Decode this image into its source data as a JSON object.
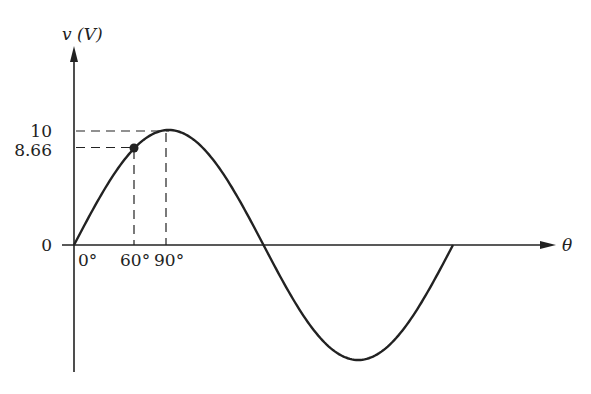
{
  "chart_data": {
    "type": "line",
    "title": "",
    "xlabel": "θ",
    "ylabel": "v (V)",
    "x_ticks": [
      "0°",
      "60°",
      "90°"
    ],
    "y_ticks": [
      "0",
      "8.66",
      "10"
    ],
    "xlim": [
      0,
      360
    ],
    "ylim": [
      -10,
      10
    ],
    "grid": false,
    "legend": null,
    "series": [
      {
        "name": "v = 10 sin θ",
        "amplitude": 10,
        "x": [
          0,
          30,
          60,
          90,
          120,
          150,
          180,
          210,
          240,
          270,
          300,
          330,
          360
        ],
        "values": [
          0,
          5,
          8.66,
          10,
          8.66,
          5,
          0,
          -5,
          -8.66,
          -10,
          -8.66,
          -5,
          0
        ]
      }
    ],
    "annotations": [
      {
        "type": "point",
        "x": 60,
        "y": 8.66,
        "label": "8.66 at 60°"
      },
      {
        "type": "dashed-guide",
        "x": 60,
        "y": 8.66
      },
      {
        "type": "dashed-guide",
        "x": 90,
        "y": 10
      }
    ]
  },
  "labels": {
    "y_axis": "v (V)",
    "x_axis": "θ",
    "y_10": "10",
    "y_866": "8.66",
    "y_0": "0",
    "x_0": "0°",
    "x_60": "60°",
    "x_90": "90°"
  },
  "colors": {
    "line": "#222222",
    "background": "#ffffff"
  }
}
